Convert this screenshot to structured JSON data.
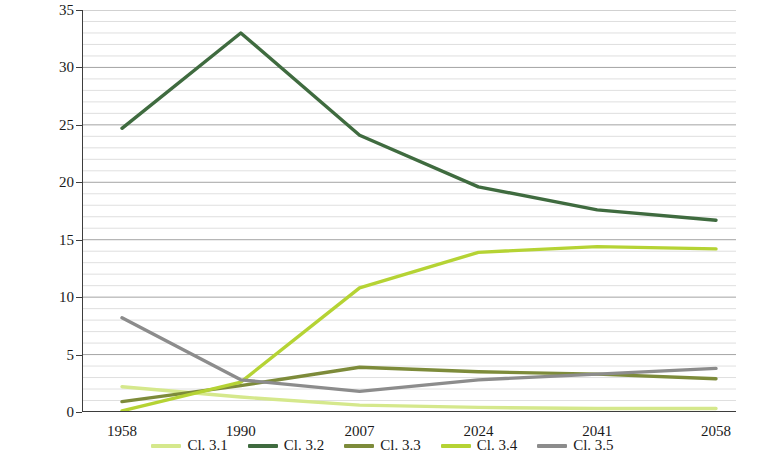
{
  "chart_data": {
    "type": "line",
    "title": "",
    "xlabel": "",
    "ylabel": "LULCT area (% of total area)",
    "categories": [
      "1958",
      "1990",
      "2007",
      "2024",
      "2041",
      "2058"
    ],
    "ylim": [
      0,
      35
    ],
    "yticks": [
      0,
      5,
      10,
      15,
      20,
      25,
      30,
      35
    ],
    "grid": true,
    "grid_orientation": "horizontal-minor",
    "legend_position": "bottom",
    "series": [
      {
        "name": "Cl. 3.1",
        "color": "#d5e88c",
        "values": [
          2.2,
          1.3,
          0.6,
          0.4,
          0.3,
          0.3
        ]
      },
      {
        "name": "Cl. 3.2",
        "color": "#3f6b3f",
        "values": [
          24.7,
          33.0,
          24.1,
          19.6,
          17.6,
          16.7
        ]
      },
      {
        "name": "Cl. 3.3",
        "color": "#7d8b3a",
        "values": [
          0.9,
          2.3,
          3.9,
          3.5,
          3.3,
          2.9
        ]
      },
      {
        "name": "Cl. 3.4",
        "color": "#b5d334",
        "values": [
          0.1,
          2.6,
          10.8,
          13.9,
          14.4,
          14.2
        ]
      },
      {
        "name": "Cl. 3.5",
        "color": "#8c8c8c",
        "values": [
          8.2,
          2.8,
          1.8,
          2.8,
          3.3,
          3.8
        ]
      }
    ]
  },
  "axis": {
    "ytick_labels": [
      "0",
      "5",
      "10",
      "15",
      "20",
      "25",
      "30",
      "35"
    ],
    "xtick_labels": [
      "1958",
      "1990",
      "2007",
      "2024",
      "2041",
      "2058"
    ],
    "ylabel_text": "LULCT area (% of total area)"
  },
  "legend": {
    "items": [
      {
        "label": "Cl. 3.1",
        "color": "#d5e88c"
      },
      {
        "label": "Cl. 3.2",
        "color": "#3f6b3f"
      },
      {
        "label": "Cl. 3.3",
        "color": "#7d8b3a"
      },
      {
        "label": "Cl. 3.4",
        "color": "#b5d334",
        "extra": ""
      },
      {
        "label": "Cl. 3.5",
        "color": "#8c8c8c"
      }
    ]
  }
}
